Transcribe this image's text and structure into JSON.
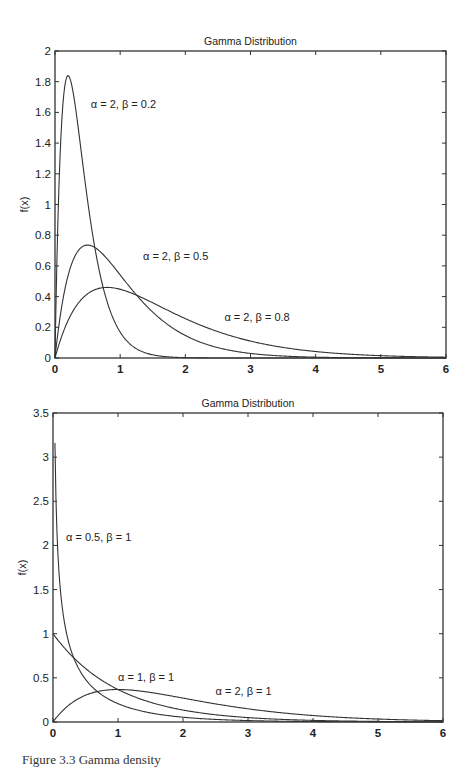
{
  "chart_data": [
    {
      "type": "line",
      "title": "Gamma Distribution",
      "xlabel": "",
      "ylabel": "f(x)",
      "xlim": [
        0,
        6
      ],
      "ylim": [
        0,
        2
      ],
      "xticks": [
        0,
        1,
        2,
        3,
        4,
        5,
        6
      ],
      "yticks": [
        0,
        0.2,
        0.4,
        0.6,
        0.8,
        1,
        1.2,
        1.4,
        1.6,
        1.8,
        2
      ],
      "grid": false,
      "series": [
        {
          "name": "α = 2, β = 0.2",
          "alpha": 2,
          "beta": 0.2,
          "peak": {
            "x": 0.2,
            "y": 1.84
          },
          "label_pos": {
            "x": 0.55,
            "y": 1.63
          }
        },
        {
          "name": "α = 2, β = 0.5",
          "alpha": 2,
          "beta": 0.5,
          "peak": {
            "x": 0.5,
            "y": 0.74
          },
          "label_pos": {
            "x": 1.35,
            "y": 0.64
          }
        },
        {
          "name": "α = 2, β = 0.8",
          "alpha": 2,
          "beta": 0.8,
          "peak": {
            "x": 0.8,
            "y": 0.46
          },
          "label_pos": {
            "x": 2.6,
            "y": 0.24
          }
        }
      ]
    },
    {
      "type": "line",
      "title": "Gamma Distribution",
      "xlabel": "",
      "ylabel": "f(x)",
      "xlim": [
        0,
        6
      ],
      "ylim": [
        0,
        3.5
      ],
      "xticks": [
        0,
        1,
        2,
        3,
        4,
        5,
        6
      ],
      "yticks": [
        0,
        0.5,
        1,
        1.5,
        2,
        2.5,
        3,
        3.5
      ],
      "grid": false,
      "series": [
        {
          "name": "α = 0.5, β = 1",
          "alpha": 0.5,
          "beta": 1,
          "start": {
            "x": 0.03,
            "y": 3.17
          },
          "label_pos": {
            "x": 0.2,
            "y": 2.05
          }
        },
        {
          "name": "α = 1, β = 1",
          "alpha": 1,
          "beta": 1,
          "start": {
            "x": 0,
            "y": 1.0
          },
          "label_pos": {
            "x": 1.0,
            "y": 0.46
          }
        },
        {
          "name": "α = 2, β = 1",
          "alpha": 2,
          "beta": 1,
          "peak": {
            "x": 1.0,
            "y": 0.37
          },
          "label_pos": {
            "x": 2.5,
            "y": 0.31
          }
        }
      ]
    }
  ],
  "caption": "Figure 3.3  Gamma density"
}
